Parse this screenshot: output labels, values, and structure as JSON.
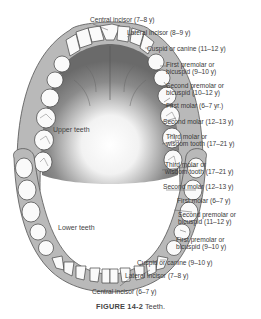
{
  "figure": {
    "number": "FIGURE 14-2",
    "caption": "Teeth.",
    "upper_label": "Upper teeth",
    "lower_label": "Lower teeth",
    "upper_teeth": [
      {
        "name": "Central incisor",
        "age": "(7–8 y)",
        "text": "Central incisor (7–8 y)"
      },
      {
        "name": "Lateral incisor",
        "age": "(8–9 y)",
        "text": "Lateral incisor (8–9 y)"
      },
      {
        "name": "Cuspid or canine",
        "age": "(11–12 y)",
        "text": "Cuspid or canine (11–12 y)"
      },
      {
        "name": "First premolar or bicuspid",
        "age": "(9–10 y)",
        "line1": "First premolar or",
        "line2": "bicuspid (9–10 y)"
      },
      {
        "name": "Second premolar or bicuspid",
        "age": "(10–12 y)",
        "line1": "Second premolar or",
        "line2": "bicuspid (10–12 y)"
      },
      {
        "name": "First molar",
        "age": "(6–7 yr.)",
        "text": "First molar (6–7 yr.)"
      },
      {
        "name": "Second molar",
        "age": "(12–13 y)",
        "text": "Second molar (12–13 y)"
      },
      {
        "name": "Third molar or wisdom tooth",
        "age": "(17–21 y)",
        "line1": "Third molar or",
        "line2": "wisdom tooth (17–21 y)"
      }
    ],
    "lower_teeth": [
      {
        "name": "Third molar or wisdom tooth",
        "age": "(17–21 y)",
        "line1": "Third molar or",
        "line2": "wisdom tooth (17–21 y)"
      },
      {
        "name": "Second molar",
        "age": "(12–13 y)",
        "text": "Second molar (12–13 y)"
      },
      {
        "name": "First molar",
        "age": "(6–7 y)",
        "text": "First molar (6–7 y)"
      },
      {
        "name": "Second premolar or bicuspid",
        "age": "(11–12 y)",
        "line1": "Second premolar or",
        "line2": "bicuspid (11–12 y)"
      },
      {
        "name": "First premolar or bicuspid",
        "age": "(9–10 y)",
        "line1": "First premolar or",
        "line2": "bicuspid (9–10 y)"
      },
      {
        "name": "Cuspid or canine",
        "age": "(9–10 y)",
        "text": "Cuspid or canine (9–10 y)"
      },
      {
        "name": "Lateral incisor",
        "age": "(7–8 y)",
        "text": "Lateral incisor (7–8 y)"
      },
      {
        "name": "Central incisor",
        "age": "(6–7 y)",
        "text": "Central incisor (6–7 y)"
      }
    ]
  }
}
